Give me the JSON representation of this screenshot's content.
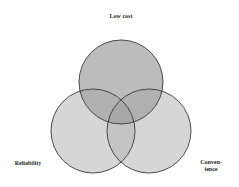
{
  "diagram": {
    "type": "venn",
    "sets": [
      {
        "id": "low-cost",
        "label": "Low cost",
        "cx": 121,
        "cy": 82,
        "r": 42,
        "fill": "#b8b8b8"
      },
      {
        "id": "reliability",
        "label": "Reliability",
        "cx": 93,
        "cy": 131,
        "r": 42,
        "fill": "#d4d4d4"
      },
      {
        "id": "convenience",
        "label_line1": "Conven-",
        "label_line2": "ience",
        "cx": 149,
        "cy": 131,
        "r": 42,
        "fill": "#d4d4d4"
      }
    ],
    "stroke": "#3a3a3a",
    "background": "#ffffff"
  }
}
